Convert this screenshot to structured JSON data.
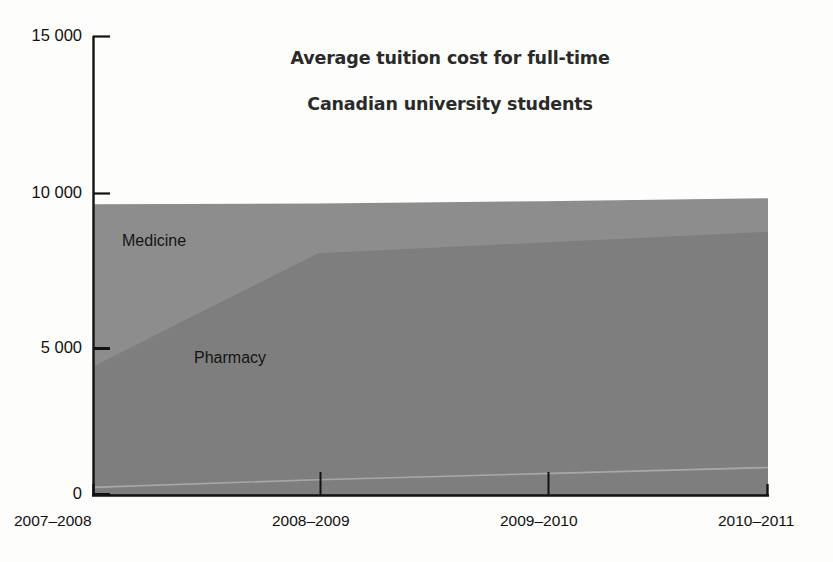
{
  "chart_data": {
    "type": "area",
    "title": "Average tuition cost for full-time\nCanadian university students",
    "title_line1": "Average tuition cost for full-time",
    "title_line2": "Canadian university students",
    "xlabel": "",
    "ylabel": "",
    "stacked": false,
    "grid": false,
    "legend_position": "in-plot",
    "categories": [
      "2007–2008",
      "2008–2009",
      "2009–2010",
      "2010–2011"
    ],
    "ylim": [
      0,
      15000
    ],
    "yticks": [
      0,
      5000,
      10000,
      15000
    ],
    "ytick_labels": [
      "0",
      "5 000",
      "10 000",
      "15 000"
    ],
    "series": [
      {
        "name": "Medicine",
        "label": "Medicine",
        "color": "#8d8d8d",
        "values": [
          9500,
          9530,
          9600,
          9700
        ]
      },
      {
        "name": "Pharmacy",
        "label": "Pharmacy",
        "color": "#7e7e7e",
        "values": [
          4200,
          7900,
          8250,
          8600
        ]
      },
      {
        "name": "Baseline",
        "label": "",
        "color": "#7e7e7e",
        "values": [
          250,
          500,
          700,
          900
        ]
      }
    ],
    "annotations": [
      {
        "text": "Medicine",
        "x_frac": 0.09,
        "y_value": 8500
      },
      {
        "text": "Pharmacy",
        "x_frac": 0.16,
        "y_value": 4600
      }
    ],
    "colors": {
      "medicine_fill": "#8d8d8d",
      "pharmacy_fill": "#7e7e7e",
      "background": "#fdfdfb",
      "axis": "#121212",
      "text": "#111111",
      "title": "#2a2a2a"
    }
  }
}
